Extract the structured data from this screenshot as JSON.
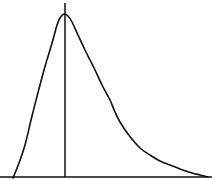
{
  "figure": {
    "title": "",
    "background_color": "#ffffff",
    "width": 222,
    "height": 181
  },
  "chart_data": {
    "type": "line",
    "title": "",
    "subtitle": "",
    "xlabel": "",
    "ylabel": "",
    "grid": false,
    "legend_position": "none",
    "xlim": [
      0,
      222
    ],
    "ylim": [
      0,
      181
    ],
    "axis_inverted_y": true,
    "series": [
      {
        "name": "density-curve",
        "color": "#111111",
        "stroke_width": 1.6,
        "x": [
          13,
          19,
          25,
          32,
          40,
          46,
          50,
          54,
          57,
          60,
          64,
          68,
          72,
          78,
          85,
          90,
          95,
          102,
          110,
          115,
          120,
          128,
          140,
          150,
          160,
          170,
          180,
          192,
          200,
          208
        ],
        "y": [
          178,
          163,
          145,
          116,
          85,
          63,
          50,
          36,
          25,
          18,
          14,
          16,
          22,
          35,
          50,
          60,
          70,
          85,
          100,
          112,
          122,
          134,
          148,
          155,
          161,
          165,
          169,
          173,
          175,
          177
        ]
      }
    ],
    "annotations": [
      {
        "name": "baseline-axis",
        "type": "line",
        "x1": 0,
        "y1": 177,
        "x2": 212,
        "y2": 177,
        "color": "#111111",
        "stroke_width": 1.6
      },
      {
        "name": "mode-line",
        "type": "line",
        "x1": 65,
        "y1": 3,
        "x2": 65,
        "y2": 177,
        "color": "#111111",
        "stroke_width": 1.5
      }
    ],
    "peak": {
      "x": 64,
      "y": 14,
      "label": ""
    },
    "colors": {
      "curve": "#111111",
      "axis": "#111111",
      "mode_line": "#111111",
      "background": "#ffffff"
    }
  }
}
